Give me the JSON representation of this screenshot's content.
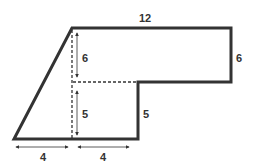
{
  "diagram": {
    "type": "composite-shape",
    "labels": {
      "top_width": "12",
      "right_height": "6",
      "upper_inner_height": "6",
      "lower_inner_height": "5",
      "step_height": "5",
      "bottom_left_width": "4",
      "bottom_right_width": "4"
    },
    "colors": {
      "outline": "#333333",
      "dashed": "#333333",
      "arrows": "#333333"
    }
  }
}
